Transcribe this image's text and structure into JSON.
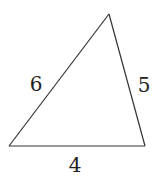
{
  "diagram": {
    "type": "triangle",
    "vertices": {
      "top": {
        "x": 109,
        "y": 14
      },
      "bottom_left": {
        "x": 9,
        "y": 146
      },
      "bottom_right": {
        "x": 145,
        "y": 146
      }
    },
    "sides": [
      {
        "name": "left",
        "label": "6",
        "from": "bottom_left",
        "to": "top",
        "label_pos": {
          "x": 36,
          "y": 91
        }
      },
      {
        "name": "right",
        "label": "5",
        "from": "top",
        "to": "bottom_right",
        "label_pos": {
          "x": 144,
          "y": 92
        }
      },
      {
        "name": "bottom",
        "label": "4",
        "from": "bottom_left",
        "to": "bottom_right",
        "label_pos": {
          "x": 75,
          "y": 172
        }
      }
    ],
    "colors": {
      "stroke": "#333333",
      "text": "#222222",
      "background": "#ffffff"
    }
  }
}
